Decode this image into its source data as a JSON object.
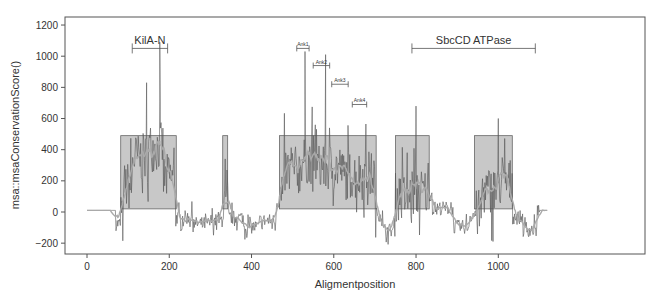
{
  "chart_data": {
    "type": "line",
    "title": "",
    "xlabel": "Aligmentposition",
    "ylabel": "msa::msaConservationScore()",
    "xlim": [
      -30,
      1160
    ],
    "ylim": [
      -250,
      1250
    ],
    "x_ticks": [
      0,
      200,
      400,
      600,
      800,
      1000
    ],
    "y_ticks": [
      -200,
      0,
      200,
      400,
      600,
      800,
      1000,
      1200
    ],
    "grid": false,
    "series": [
      {
        "name": "conservation score (raw)",
        "color": "#555555"
      },
      {
        "name": "conservation score (smoothed)",
        "color": "#aaaaaa"
      }
    ],
    "flat_regions": [
      {
        "x_start": 0,
        "x_end": 70,
        "value": 10
      },
      {
        "x_start": 1100,
        "x_end": 1120,
        "value": 10
      }
    ],
    "highlight_boxes": [
      {
        "x_start": 82,
        "x_end": 217,
        "y_bottom": 20,
        "y_top": 490
      },
      {
        "x_start": 330,
        "x_end": 342,
        "y_bottom": 20,
        "y_top": 490
      },
      {
        "x_start": 468,
        "x_end": 703,
        "y_bottom": 20,
        "y_top": 490
      },
      {
        "x_start": 750,
        "x_end": 832,
        "y_bottom": 20,
        "y_top": 490
      },
      {
        "x_start": 942,
        "x_end": 1034,
        "y_bottom": 20,
        "y_top": 490
      }
    ],
    "domain_annotations": [
      {
        "label": "KilA-N",
        "x_start": 110,
        "x_end": 196,
        "y": 1050,
        "size": "large"
      },
      {
        "label": "SbcCD ATPase",
        "x_start": 790,
        "x_end": 1090,
        "y": 1050,
        "size": "large"
      },
      {
        "label": "Ank1",
        "x_start": 510,
        "x_end": 540,
        "y": 1050,
        "size": "small"
      },
      {
        "label": "Ank2",
        "x_start": 550,
        "x_end": 590,
        "y": 940,
        "size": "small"
      },
      {
        "label": "Ank3",
        "x_start": 595,
        "x_end": 635,
        "y": 820,
        "size": "small"
      },
      {
        "label": "Ank4",
        "x_start": 645,
        "x_end": 680,
        "y": 690,
        "size": "small"
      }
    ],
    "notable_peaks": [
      {
        "x": 145,
        "y": 830
      },
      {
        "x": 177,
        "y": 1090
      },
      {
        "x": 530,
        "y": 1030
      },
      {
        "x": 580,
        "y": 1010
      },
      {
        "x": 800,
        "y": 680
      },
      {
        "x": 1000,
        "y": 600
      }
    ]
  }
}
